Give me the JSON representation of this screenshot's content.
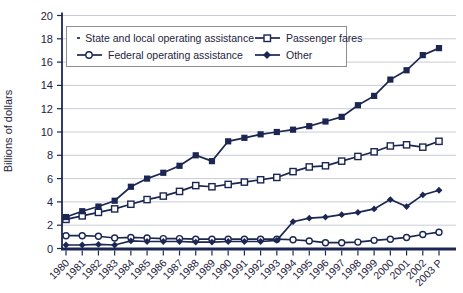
{
  "chart_data": {
    "type": "line",
    "title": "",
    "xlabel": "",
    "ylabel": "Billions of dollars",
    "ylim": [
      0,
      20
    ],
    "yticks": [
      0,
      2,
      4,
      6,
      8,
      10,
      12,
      14,
      16,
      18,
      20
    ],
    "grid": "horizontal",
    "legend_position": "top-left-box",
    "categories": [
      "1980",
      "1981",
      "1982",
      "1983",
      "1984",
      "1985",
      "1986",
      "1987",
      "1988",
      "1989",
      "1990",
      "1991",
      "1992",
      "1993",
      "1994",
      "1995",
      "1996",
      "1997",
      "1998",
      "1999",
      "2000",
      "2001",
      "2002",
      "2003 P"
    ],
    "series": [
      {
        "name": "State and local operating assistance",
        "marker": "filled-square",
        "values": [
          2.7,
          3.2,
          3.6,
          4.1,
          5.3,
          6.0,
          6.5,
          7.1,
          8.0,
          7.5,
          9.2,
          9.5,
          9.8,
          10.0,
          10.2,
          10.5,
          10.9,
          11.3,
          12.3,
          13.1,
          14.5,
          15.3,
          16.6,
          17.2
        ]
      },
      {
        "name": "Passenger fares",
        "marker": "open-square",
        "values": [
          2.5,
          2.8,
          3.1,
          3.4,
          3.8,
          4.2,
          4.5,
          4.9,
          5.4,
          5.3,
          5.5,
          5.7,
          5.9,
          6.1,
          6.6,
          7.0,
          7.1,
          7.5,
          7.9,
          8.3,
          8.8,
          8.9,
          8.7,
          9.2
        ]
      },
      {
        "name": "Federal operating assistance",
        "marker": "open-circle",
        "values": [
          1.1,
          1.1,
          1.05,
          0.9,
          0.95,
          0.9,
          0.85,
          0.85,
          0.8,
          0.8,
          0.8,
          0.8,
          0.8,
          0.8,
          0.75,
          0.65,
          0.5,
          0.5,
          0.55,
          0.7,
          0.8,
          0.95,
          1.2,
          1.4
        ]
      },
      {
        "name": "Other",
        "marker": "filled-diamond",
        "values": [
          0.3,
          0.3,
          0.35,
          0.3,
          0.65,
          0.6,
          0.6,
          0.6,
          0.55,
          0.55,
          0.6,
          0.6,
          0.6,
          0.7,
          2.3,
          2.6,
          2.7,
          2.9,
          3.1,
          3.4,
          4.2,
          3.6,
          4.6,
          5.0
        ]
      }
    ],
    "colors": {
      "line": "#1b2653",
      "grid": "#c9ccd4",
      "text": "#1e2440",
      "legend_border": "#8a8f98",
      "background": "#ffffff"
    }
  }
}
